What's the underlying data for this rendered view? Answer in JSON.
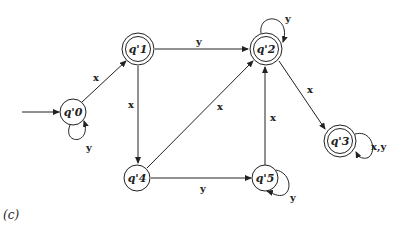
{
  "caption": "(c)",
  "states": [
    {
      "id": "q0",
      "label": "q'0",
      "x": 73,
      "y": 112,
      "r": 13,
      "accepting": false,
      "initial": true
    },
    {
      "id": "q1",
      "label": "q'1",
      "x": 138,
      "y": 49,
      "r": 16,
      "accepting": true,
      "initial": false
    },
    {
      "id": "q2",
      "label": "q'2",
      "x": 266,
      "y": 49,
      "r": 16,
      "accepting": true,
      "initial": false
    },
    {
      "id": "q3",
      "label": "q'3",
      "x": 340,
      "y": 141,
      "r": 16,
      "accepting": true,
      "initial": false
    },
    {
      "id": "q4",
      "label": "q'4",
      "x": 137,
      "y": 178,
      "r": 13,
      "accepting": false,
      "initial": false
    },
    {
      "id": "q5",
      "label": "q'5",
      "x": 265,
      "y": 178,
      "r": 13,
      "accepting": false,
      "initial": false
    }
  ],
  "transitions": [
    {
      "from": "q0",
      "to": "q1",
      "label": "x"
    },
    {
      "from": "q0",
      "to": "q0",
      "label": "y"
    },
    {
      "from": "q1",
      "to": "q2",
      "label": "y"
    },
    {
      "from": "q1",
      "to": "q4",
      "label": "x"
    },
    {
      "from": "q2",
      "to": "q2",
      "label": "y"
    },
    {
      "from": "q2",
      "to": "q3",
      "label": "x"
    },
    {
      "from": "q3",
      "to": "q3",
      "label": "x,y"
    },
    {
      "from": "q4",
      "to": "q2",
      "label": "x"
    },
    {
      "from": "q4",
      "to": "q5",
      "label": "y"
    },
    {
      "from": "q5",
      "to": "q2",
      "label": "x"
    },
    {
      "from": "q5",
      "to": "q5",
      "label": "y"
    }
  ]
}
